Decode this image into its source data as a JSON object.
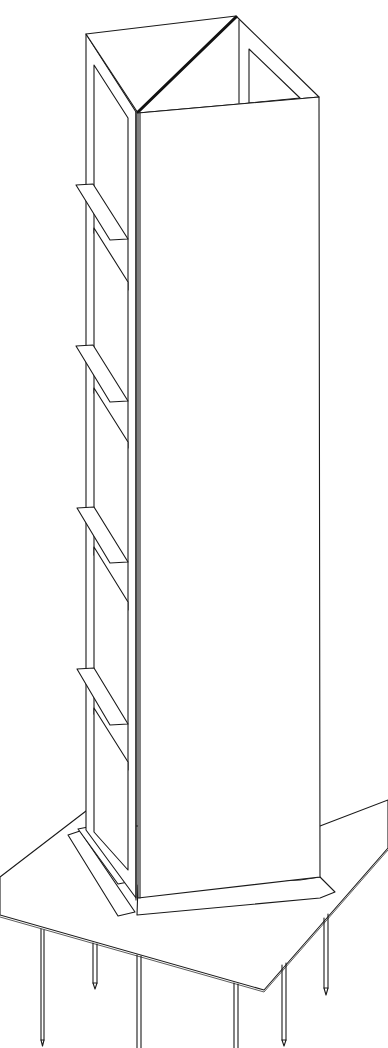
{
  "figure": {
    "type": "patent-style line drawing",
    "colors": {
      "line": "#1a1a1a",
      "background": "#ffffff"
    }
  },
  "tower": {
    "faces": 3,
    "windowed_face_windows": 5,
    "shelves": 5
  },
  "base": {
    "plate": "quadrilateral ground plate",
    "stakes": 6
  }
}
